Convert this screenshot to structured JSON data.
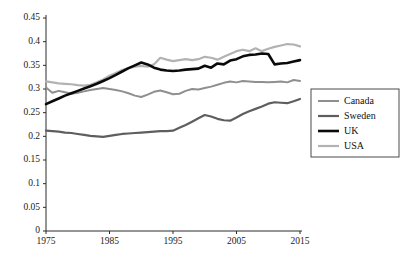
{
  "chart_data": {
    "type": "line",
    "title": "",
    "subtitle": "",
    "xlabel": "",
    "ylabel": "",
    "xlim": [
      1975,
      2015
    ],
    "ylim": [
      0,
      0.45
    ],
    "xticks": [
      "1975",
      "1985",
      "1995",
      "2005",
      "2015"
    ],
    "yticks": [
      "0",
      "0.05",
      "0.1",
      "0.15",
      "0.2",
      "0.25",
      "0.3",
      "0.35",
      "0.4",
      "0.45"
    ],
    "grid": false,
    "legend_position": "right",
    "x": [
      1975,
      1976,
      1977,
      1978,
      1979,
      1980,
      1981,
      1982,
      1983,
      1984,
      1985,
      1986,
      1987,
      1988,
      1989,
      1990,
      1991,
      1992,
      1993,
      1994,
      1995,
      1996,
      1997,
      1998,
      1999,
      2000,
      2001,
      2002,
      2003,
      2004,
      2005,
      2006,
      2007,
      2008,
      2009,
      2010,
      2011,
      2012,
      2013,
      2014,
      2015
    ],
    "series": [
      {
        "name": "Canada",
        "color": "#8f8f8f",
        "width": 2.0,
        "values": [
          0.303,
          0.292,
          0.296,
          0.293,
          0.29,
          0.292,
          0.295,
          0.298,
          0.3,
          0.302,
          0.3,
          0.298,
          0.295,
          0.291,
          0.286,
          0.283,
          0.288,
          0.294,
          0.297,
          0.293,
          0.289,
          0.29,
          0.296,
          0.3,
          0.299,
          0.302,
          0.305,
          0.309,
          0.313,
          0.316,
          0.314,
          0.317,
          0.316,
          0.315,
          0.315,
          0.314,
          0.315,
          0.316,
          0.314,
          0.319,
          0.317
        ]
      },
      {
        "name": "Sweden",
        "color": "#5e5e5e",
        "width": 2.2,
        "values": [
          0.212,
          0.211,
          0.21,
          0.208,
          0.207,
          0.205,
          0.203,
          0.201,
          0.2,
          0.199,
          0.201,
          0.203,
          0.205,
          0.206,
          0.207,
          0.208,
          0.209,
          0.21,
          0.211,
          0.211,
          0.212,
          0.218,
          0.224,
          0.231,
          0.238,
          0.245,
          0.242,
          0.237,
          0.234,
          0.233,
          0.24,
          0.247,
          0.253,
          0.258,
          0.263,
          0.269,
          0.272,
          0.271,
          0.27,
          0.274,
          0.279
        ]
      },
      {
        "name": "UK",
        "color": "#0a0a0a",
        "width": 2.6,
        "values": [
          0.268,
          0.274,
          0.28,
          0.286,
          0.291,
          0.296,
          0.301,
          0.306,
          0.311,
          0.317,
          0.323,
          0.33,
          0.337,
          0.344,
          0.35,
          0.356,
          0.352,
          0.345,
          0.341,
          0.339,
          0.338,
          0.339,
          0.341,
          0.342,
          0.343,
          0.349,
          0.345,
          0.354,
          0.352,
          0.36,
          0.363,
          0.369,
          0.372,
          0.373,
          0.375,
          0.374,
          0.352,
          0.354,
          0.355,
          0.358,
          0.361
        ]
      },
      {
        "name": "USA",
        "color": "#b2b2b2",
        "width": 2.2,
        "values": [
          0.316,
          0.314,
          0.312,
          0.311,
          0.31,
          0.308,
          0.307,
          0.309,
          0.314,
          0.32,
          0.328,
          0.334,
          0.34,
          0.344,
          0.347,
          0.349,
          0.347,
          0.352,
          0.366,
          0.362,
          0.359,
          0.361,
          0.363,
          0.361,
          0.363,
          0.368,
          0.366,
          0.362,
          0.368,
          0.374,
          0.38,
          0.383,
          0.38,
          0.386,
          0.38,
          0.385,
          0.389,
          0.392,
          0.395,
          0.394,
          0.39
        ]
      }
    ]
  },
  "legend": {
    "items": [
      {
        "label": "Canada"
      },
      {
        "label": "Sweden"
      },
      {
        "label": "UK"
      },
      {
        "label": "USA"
      }
    ]
  }
}
